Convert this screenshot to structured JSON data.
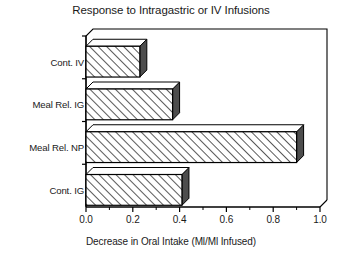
{
  "chart_data": {
    "type": "bar",
    "orientation": "horizontal",
    "style": "3d-hatched",
    "title": "Response to Intragastric or IV Infusions",
    "xlabel": "Decrease in Oral Intake (Ml/Ml Infused)",
    "ylabel": "",
    "categories": [
      "Cont. IG",
      "Meal Rel. NP",
      "Meal Rel. IG",
      "Cont. IV"
    ],
    "values": [
      0.41,
      0.9,
      0.37,
      0.23
    ],
    "xlim": [
      0.0,
      1.0
    ],
    "xticks": [
      0.0,
      0.2,
      0.4,
      0.6,
      0.8,
      1.0
    ],
    "xtick_labels": [
      "0.0",
      "0.2",
      "0.4",
      "0.6",
      "0.8",
      "1.0"
    ],
    "minor_xticks": [
      0.1,
      0.3,
      0.5,
      0.7,
      0.9
    ],
    "grid": false,
    "legend": null,
    "bar_fill": "diagonal-hatch",
    "bar_face_color": "#ffffff",
    "bar_side_color": "#4d4d4d",
    "bar_top_color": "#ffffff",
    "line_color": "#000000"
  },
  "axis": {
    "x_tick_labels": [
      "0.0",
      "0.2",
      "0.4",
      "0.6",
      "0.8",
      "1.0"
    ],
    "y_tick_labels": [
      "Cont. IV",
      "Meal Rel. IG",
      "Meal Rel. NP",
      "Cont. IG"
    ]
  }
}
